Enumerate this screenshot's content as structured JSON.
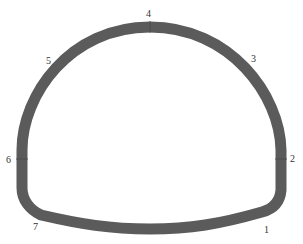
{
  "diagram": {
    "type": "tunnel-lining-cross-section",
    "lining_color": "#5b5b5b",
    "label_color": "#333333",
    "points": [
      {
        "id": "1",
        "label": "1",
        "x": 266,
        "y": 232
      },
      {
        "id": "2",
        "label": "2",
        "x": 292,
        "y": 162
      },
      {
        "id": "3",
        "label": "3",
        "x": 254,
        "y": 62
      },
      {
        "id": "4",
        "label": "4",
        "x": 149,
        "y": 17
      },
      {
        "id": "5",
        "label": "5",
        "x": 49,
        "y": 64
      },
      {
        "id": "6",
        "label": "6",
        "x": 9,
        "y": 163
      },
      {
        "id": "7",
        "label": "7",
        "x": 36,
        "y": 230
      }
    ]
  }
}
